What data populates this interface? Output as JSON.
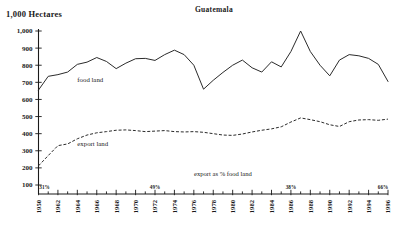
{
  "chart_data": {
    "type": "line",
    "title": "Guatemala",
    "ylabel": "1,000 Hectares",
    "xlabel": "",
    "ylim": [
      0,
      1000
    ],
    "yticks": [
      100,
      200,
      300,
      400,
      500,
      600,
      700,
      800,
      900,
      1000
    ],
    "ytick_labels": [
      "100",
      "200",
      "300",
      "400",
      "500",
      "600",
      "700",
      "800",
      "900",
      "1,000"
    ],
    "grid": false,
    "legend": "inline annotations",
    "x": [
      1960,
      1961,
      1962,
      1963,
      1964,
      1965,
      1966,
      1967,
      1968,
      1969,
      1970,
      1971,
      1972,
      1973,
      1974,
      1975,
      1976,
      1977,
      1978,
      1979,
      1980,
      1981,
      1982,
      1983,
      1984,
      1985,
      1986,
      1987,
      1988,
      1989,
      1990,
      1991,
      1992,
      1993,
      1994,
      1995,
      1996
    ],
    "xtick_labels": [
      "1950",
      "1962",
      "1964",
      "1966",
      "1968",
      "1970",
      "1972",
      "1974",
      "1976",
      "1978",
      "1980",
      "1982",
      "1984",
      "1986",
      "1988",
      "1990",
      "1992",
      "1994",
      "1996"
    ],
    "xtick_years": [
      1960,
      1962,
      1964,
      1966,
      1968,
      1970,
      1972,
      1974,
      1976,
      1978,
      1980,
      1982,
      1984,
      1986,
      1988,
      1990,
      1992,
      1994,
      1996
    ],
    "series": [
      {
        "name": "food land",
        "style": "solid",
        "label_x": 1964,
        "label_y": 700,
        "values": [
          655,
          735,
          745,
          760,
          805,
          818,
          845,
          822,
          780,
          812,
          838,
          840,
          828,
          862,
          888,
          862,
          800,
          660,
          712,
          758,
          800,
          830,
          785,
          760,
          820,
          790,
          880,
          1000,
          880,
          800,
          738,
          830,
          862,
          855,
          840,
          805,
          705
        ]
      },
      {
        "name": "export land",
        "style": "dashed",
        "label_x": 1964,
        "label_y": 330,
        "values": [
          212,
          272,
          330,
          340,
          370,
          392,
          405,
          412,
          420,
          422,
          418,
          412,
          415,
          418,
          412,
          410,
          412,
          408,
          400,
          392,
          390,
          398,
          410,
          420,
          428,
          440,
          468,
          492,
          482,
          470,
          452,
          442,
          470,
          480,
          482,
          478,
          485
        ]
      }
    ],
    "pct_annotations": [
      {
        "year": 1960,
        "text": "31%"
      },
      {
        "year": 1972,
        "text": "49%"
      },
      {
        "year": 1986,
        "text": "38%"
      },
      {
        "year": 1996,
        "text": "66%"
      }
    ],
    "inline_note": {
      "text": "export as % food land",
      "x_year": 1979,
      "y_value": 155
    }
  }
}
